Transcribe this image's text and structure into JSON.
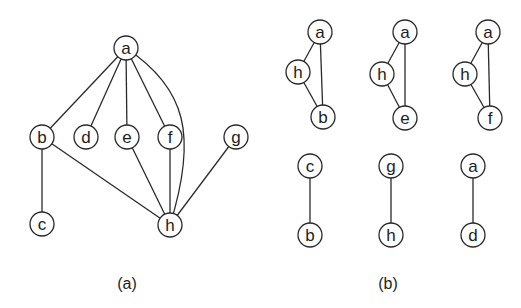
{
  "figure_a": {
    "caption": "(a)",
    "nodes": [
      {
        "id": "a",
        "label": "a",
        "x": 126,
        "y": 48
      },
      {
        "id": "b",
        "label": "b",
        "x": 42,
        "y": 137
      },
      {
        "id": "d",
        "label": "d",
        "x": 86,
        "y": 137
      },
      {
        "id": "e",
        "label": "e",
        "x": 127,
        "y": 137
      },
      {
        "id": "f",
        "label": "f",
        "x": 170,
        "y": 137
      },
      {
        "id": "g",
        "label": "g",
        "x": 236,
        "y": 137
      },
      {
        "id": "c",
        "label": "c",
        "x": 42,
        "y": 224
      },
      {
        "id": "h",
        "label": "h",
        "x": 170,
        "y": 225
      }
    ],
    "edges": [
      [
        "a",
        "b"
      ],
      [
        "a",
        "d"
      ],
      [
        "a",
        "e"
      ],
      [
        "a",
        "f"
      ],
      [
        "a",
        "h"
      ],
      [
        "b",
        "c"
      ],
      [
        "b",
        "h"
      ],
      [
        "e",
        "h"
      ],
      [
        "f",
        "h"
      ],
      [
        "g",
        "h"
      ]
    ]
  },
  "figure_b": {
    "caption": "(b)",
    "components": [
      {
        "nodes": [
          {
            "label": "a",
            "x": 320,
            "y": 32
          },
          {
            "label": "h",
            "x": 298,
            "y": 72
          },
          {
            "label": "b",
            "x": 323,
            "y": 117
          }
        ],
        "edges": [
          [
            0,
            1
          ],
          [
            0,
            2
          ],
          [
            1,
            2
          ]
        ]
      },
      {
        "nodes": [
          {
            "label": "a",
            "x": 405,
            "y": 32
          },
          {
            "label": "h",
            "x": 382,
            "y": 74
          },
          {
            "label": "e",
            "x": 405,
            "y": 118
          }
        ],
        "edges": [
          [
            0,
            1
          ],
          [
            0,
            2
          ],
          [
            1,
            2
          ]
        ]
      },
      {
        "nodes": [
          {
            "label": "a",
            "x": 488,
            "y": 32
          },
          {
            "label": "h",
            "x": 465,
            "y": 74
          },
          {
            "label": "f",
            "x": 490,
            "y": 118
          }
        ],
        "edges": [
          [
            0,
            1
          ],
          [
            0,
            2
          ],
          [
            1,
            2
          ]
        ]
      },
      {
        "nodes": [
          {
            "label": "c",
            "x": 310,
            "y": 166
          },
          {
            "label": "b",
            "x": 310,
            "y": 235
          }
        ],
        "edges": [
          [
            0,
            1
          ]
        ]
      },
      {
        "nodes": [
          {
            "label": "g",
            "x": 391,
            "y": 166
          },
          {
            "label": "h",
            "x": 391,
            "y": 235
          }
        ],
        "edges": [
          [
            0,
            1
          ]
        ]
      },
      {
        "nodes": [
          {
            "label": "a",
            "x": 473,
            "y": 166
          },
          {
            "label": "d",
            "x": 473,
            "y": 235
          }
        ],
        "edges": [
          [
            0,
            1
          ]
        ]
      }
    ]
  },
  "style": {
    "node_radius": 12,
    "stroke_color": "#2a2a2a",
    "background": "#ffffff"
  }
}
